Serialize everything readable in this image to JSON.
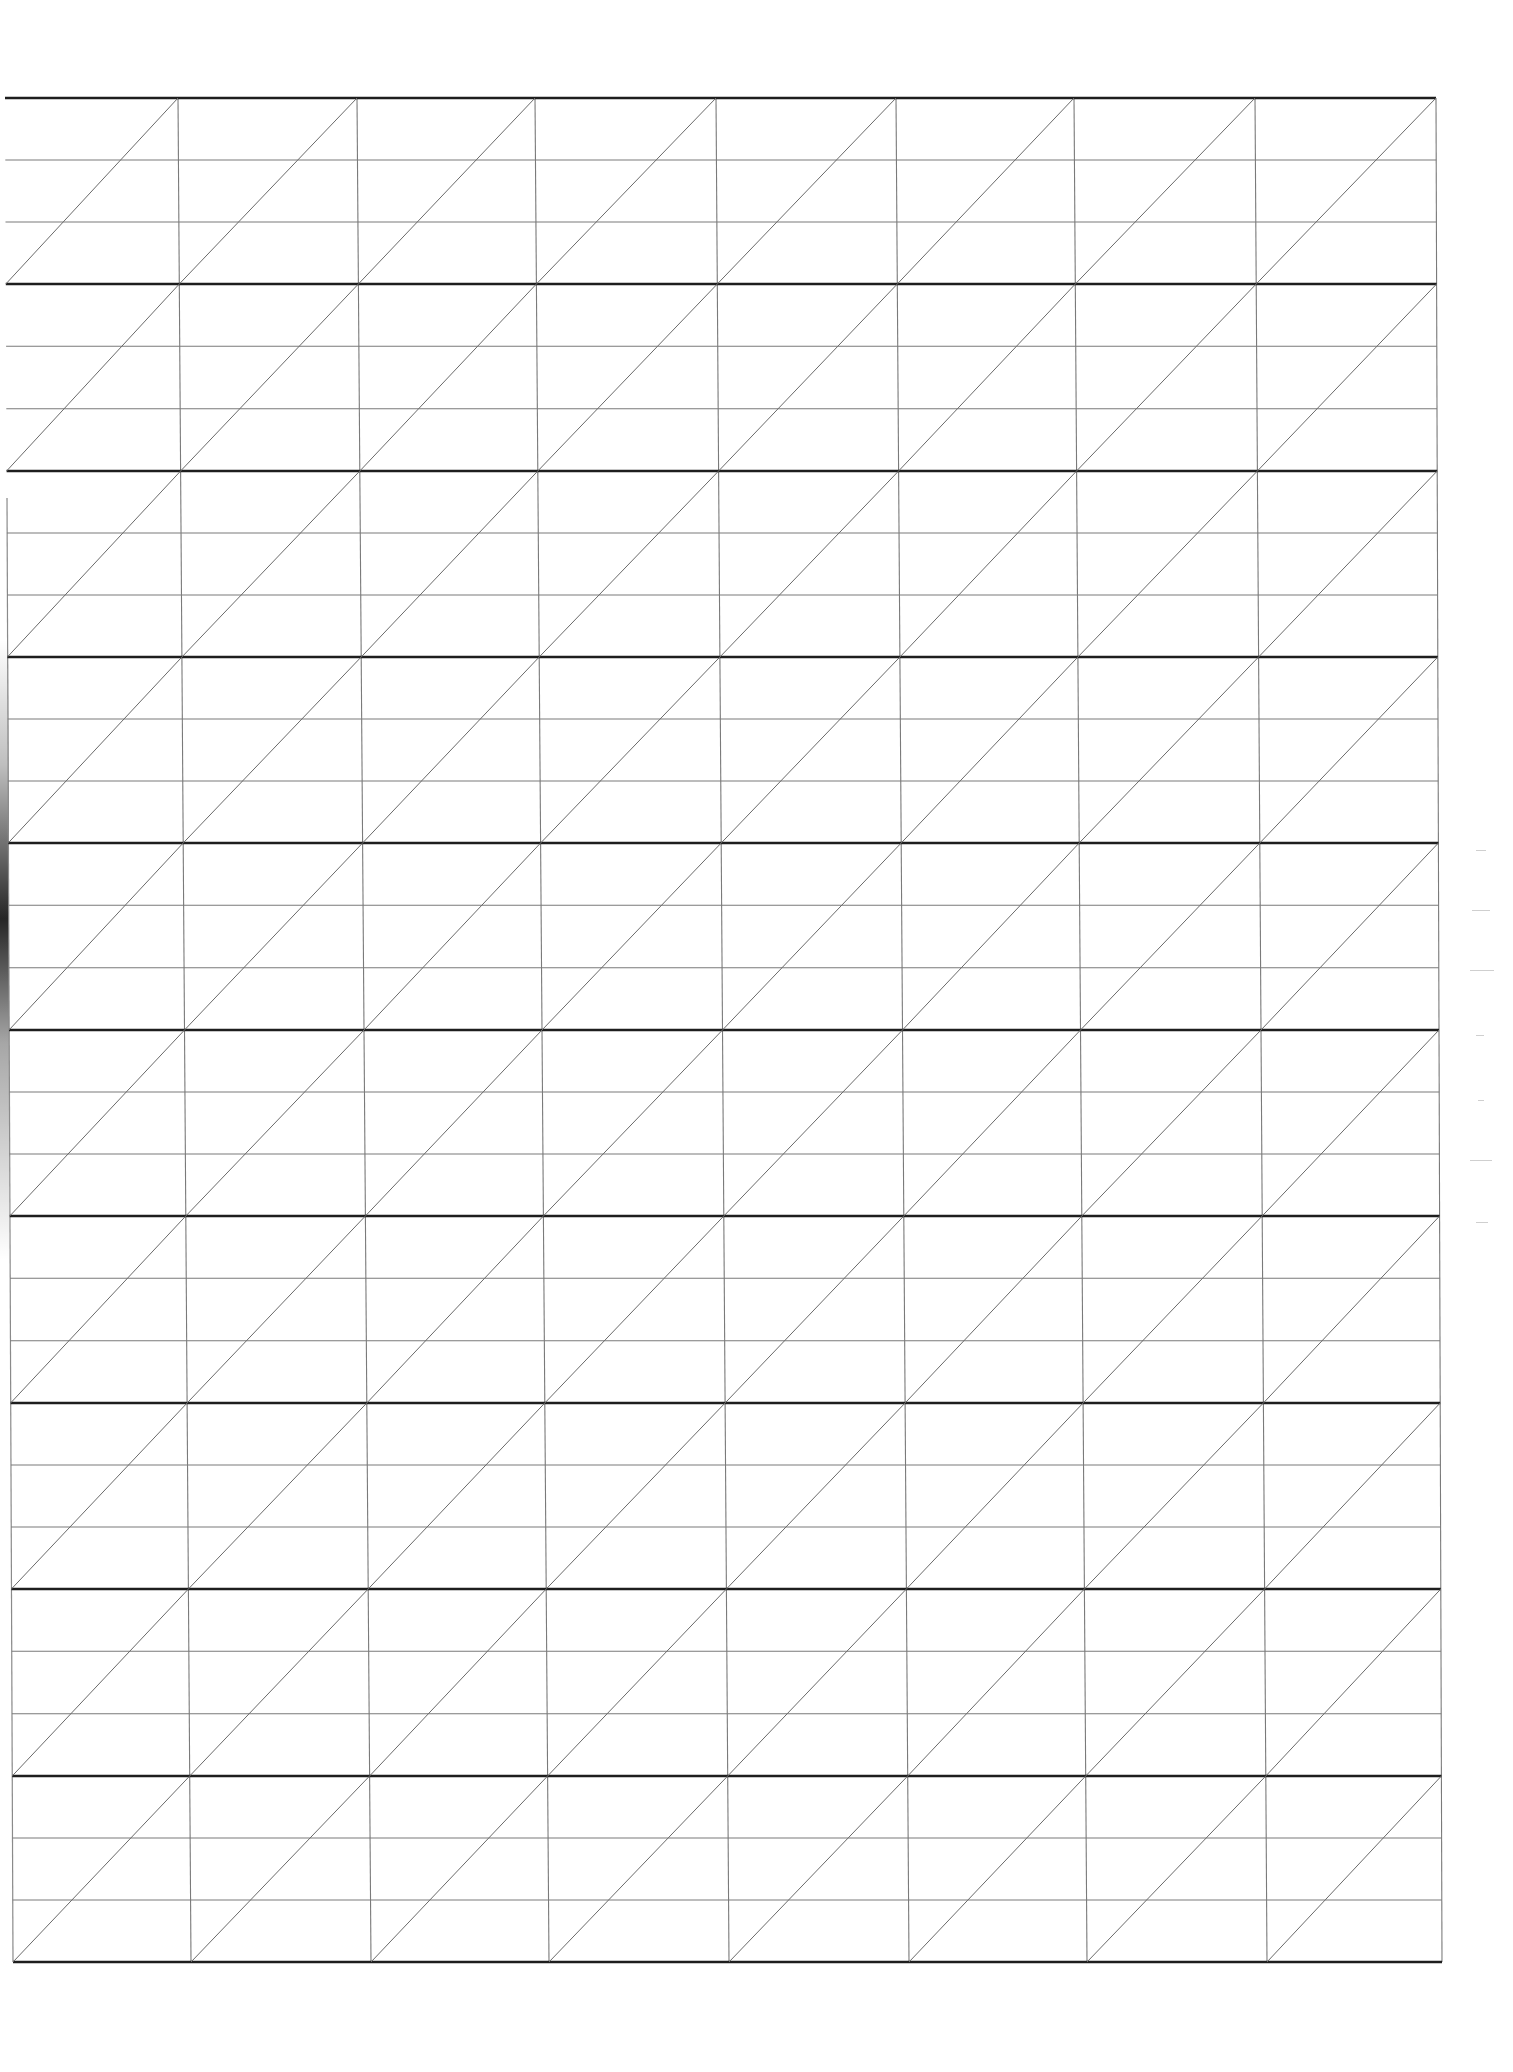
{
  "document": {
    "type": "calligraphy-slant-practice-sheet",
    "blocks": 10,
    "columns": 8,
    "sublines_per_block": 2
  },
  "grid": {
    "top_left": [
      5,
      98
    ],
    "top_right": [
      1436,
      98
    ],
    "bottom_left": [
      13,
      1962
    ],
    "bottom_right": [
      1442,
      1962
    ],
    "column_x_top": [
      178,
      357,
      535,
      716,
      896,
      1074,
      1255,
      1436
    ],
    "column_x_bottom": [
      191,
      371,
      549,
      729,
      909,
      1087,
      1267,
      1442
    ],
    "block_y": [
      98,
      284,
      471,
      657,
      843,
      1030,
      1216,
      1403,
      1589,
      1776,
      1962
    ]
  },
  "colors": {
    "background": "#ffffff",
    "thick_line": "#1e1e1e",
    "thin_line": "#7a7a7a",
    "slant_line": "#6a6a6a",
    "edge_line": "#8a8a8a"
  },
  "stroke": {
    "thick": 2.6,
    "thin": 1.1,
    "slant": 1.0
  }
}
